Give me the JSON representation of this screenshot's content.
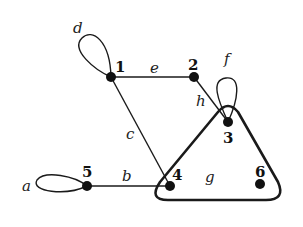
{
  "diagram": {
    "type": "hypergraph",
    "colors": {
      "stroke": "#1a1a1a",
      "node": "#111111",
      "background": "#ffffff"
    },
    "nodes": [
      {
        "id": "1",
        "label": "1",
        "x": 111,
        "y": 77
      },
      {
        "id": "2",
        "label": "2",
        "x": 194,
        "y": 77
      },
      {
        "id": "3",
        "label": "3",
        "x": 228,
        "y": 122
      },
      {
        "id": "4",
        "label": "4",
        "x": 170,
        "y": 186
      },
      {
        "id": "5",
        "label": "5",
        "x": 87,
        "y": 186
      },
      {
        "id": "6",
        "label": "6",
        "x": 260,
        "y": 184
      }
    ],
    "edges": [
      {
        "id": "a",
        "label": "a",
        "kind": "loop",
        "nodes": [
          "5"
        ]
      },
      {
        "id": "b",
        "label": "b",
        "kind": "edge",
        "nodes": [
          "5",
          "4"
        ]
      },
      {
        "id": "c",
        "label": "c",
        "kind": "edge",
        "nodes": [
          "1",
          "4"
        ]
      },
      {
        "id": "d",
        "label": "d",
        "kind": "loop",
        "nodes": [
          "1"
        ]
      },
      {
        "id": "e",
        "label": "e",
        "kind": "edge",
        "nodes": [
          "1",
          "2"
        ]
      },
      {
        "id": "f",
        "label": "f",
        "kind": "loop",
        "nodes": [
          "3"
        ]
      },
      {
        "id": "g",
        "label": "g",
        "kind": "hyperedge",
        "nodes": [
          "3",
          "4",
          "6"
        ]
      },
      {
        "id": "h",
        "label": "h",
        "kind": "edge",
        "nodes": [
          "2",
          "3"
        ]
      }
    ]
  }
}
